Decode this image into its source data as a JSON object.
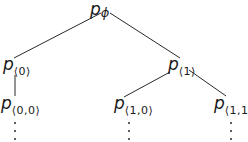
{
  "diagram": {
    "type": "tree",
    "nodes": {
      "root": {
        "base": "p",
        "sub": "ϕ"
      },
      "n0": {
        "base": "p",
        "sub": "⟨0⟩"
      },
      "n1": {
        "base": "p",
        "sub": "⟨1⟩"
      },
      "n00": {
        "base": "p",
        "sub": "⟨0,0⟩"
      },
      "n10": {
        "base": "p",
        "sub": "⟨1,0⟩"
      },
      "n11": {
        "base": "p",
        "sub": "⟨1,1⟩"
      }
    },
    "edges": [
      [
        "root",
        "n0"
      ],
      [
        "root",
        "n1"
      ],
      [
        "n0",
        "n00"
      ],
      [
        "n1",
        "n10"
      ],
      [
        "n1",
        "n11"
      ]
    ],
    "continuation": {
      "symbol": "⋮",
      "below": [
        "n00",
        "n10",
        "n11"
      ]
    },
    "colors": {
      "background": "#ffffff",
      "ink": "#1a1a1a"
    }
  }
}
